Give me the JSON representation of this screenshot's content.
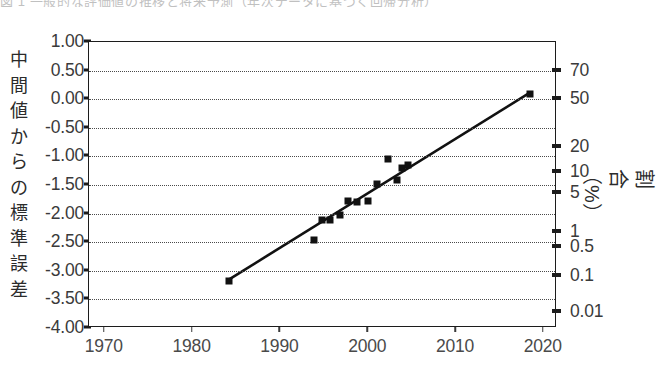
{
  "caption_fragment": "図 1  一般的な評価値の推移と将来予測（年次データに基づく回帰分析）",
  "axis": {
    "left_title": "中間値からの標準誤差",
    "right_title": "割合（%）",
    "left_ticks": [
      "1.00",
      "0.50",
      "0.00",
      "-0.50",
      "-1.00",
      "-1.50",
      "-2.00",
      "-2.50",
      "-3.00",
      "-3.50",
      "-4.00"
    ],
    "left_tick_values": [
      1.0,
      0.5,
      0.0,
      -0.5,
      -1.0,
      -1.5,
      -2.0,
      -2.5,
      -3.0,
      -3.5,
      -4.0
    ],
    "right_ticks": [
      {
        "label": "70",
        "value": 0.5
      },
      {
        "label": "50",
        "value": 0.0
      },
      {
        "label": "20",
        "value": -0.84
      },
      {
        "label": "10",
        "value": -1.28
      },
      {
        "label": "5",
        "value": -1.64
      },
      {
        "label": "1",
        "value": -2.33
      },
      {
        "label": "0.5",
        "value": -2.58
      },
      {
        "label": "0.1",
        "value": -3.09
      },
      {
        "label": "0.01",
        "value": -3.72
      }
    ],
    "x_ticks": [
      "1970",
      "1980",
      "1990",
      "2000",
      "2010",
      "2020"
    ],
    "x_tick_values": [
      1970,
      1980,
      1990,
      2000,
      2010,
      2020
    ]
  },
  "colors": {
    "ink": "#1c1c1c",
    "grid": "#4a4a4a",
    "marker": "#111111",
    "background": "#ffffff"
  },
  "chart_data": {
    "type": "scatter",
    "title": "",
    "subtitle": "",
    "xlabel": "",
    "ylabel": "中間値からの標準誤差",
    "y2label": "割合（%）",
    "xlim": [
      1968.2,
      2021.5
    ],
    "ylim": [
      -4.0,
      1.0
    ],
    "grid": true,
    "legend": "none",
    "series": [
      {
        "name": "観測値",
        "type": "scatter",
        "marker": "square",
        "points": [
          {
            "x": 1984.1,
            "y": -3.18
          },
          {
            "x": 1993.8,
            "y": -2.46
          },
          {
            "x": 1994.7,
            "y": -2.11
          },
          {
            "x": 1995.6,
            "y": -2.11
          },
          {
            "x": 1996.8,
            "y": -2.02
          },
          {
            "x": 1997.7,
            "y": -1.78
          },
          {
            "x": 1998.7,
            "y": -1.8
          },
          {
            "x": 2000.0,
            "y": -1.78
          },
          {
            "x": 2001.0,
            "y": -1.48
          },
          {
            "x": 2002.2,
            "y": -1.05
          },
          {
            "x": 2003.3,
            "y": -1.42
          },
          {
            "x": 2003.9,
            "y": -1.2
          },
          {
            "x": 2004.5,
            "y": -1.15
          },
          {
            "x": 2018.4,
            "y": 0.09
          }
        ]
      },
      {
        "name": "回帰直線",
        "type": "line",
        "points": [
          {
            "x": 1984.1,
            "y": -3.18
          },
          {
            "x": 2018.4,
            "y": 0.09
          }
        ]
      }
    ]
  }
}
